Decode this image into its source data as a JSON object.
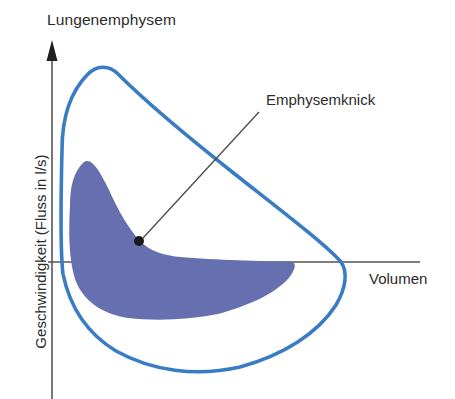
{
  "chart_data": {
    "type": "line",
    "title": "Lungenemphysem",
    "subtitle": "",
    "xlabel": "Volumen",
    "ylabel": "Geschwindigkeit (Fluss in l/s)",
    "grid": false,
    "legend_position": "none",
    "axis_style": {
      "y_axis_arrow": true,
      "x_axis_arrow": false,
      "x_axis_ticks": false,
      "y_axis_ticks": false,
      "axis_color": "#555555"
    },
    "colors": {
      "outline_curve": "#3a7cc4",
      "filled_curve": "#6670b0",
      "annotation_marker": "#1a1a1a",
      "annotation_leader": "#4a4a4a",
      "background": "#ffffff",
      "text": "#2b2b2b"
    },
    "annotations": [
      {
        "text": "Emphysemknick",
        "marker_x": 139,
        "marker_y": 241,
        "leader_to_x": 259,
        "leader_to_y": 112,
        "description": "Knick im exspiratorischen Schenkel der Fluss-Volumen-Kurve"
      }
    ],
    "series": [
      {
        "name": "Emphysem-Fluss-Volumen-Schleife (Aussenkurve)",
        "color": "#3a7cc4",
        "filled": false,
        "style": "loop",
        "points": [
          [
            62,
            148
          ],
          [
            63,
            120
          ],
          [
            68,
            98
          ],
          [
            78,
            82
          ],
          [
            90,
            70
          ],
          [
            102,
            66
          ],
          [
            118,
            73
          ],
          [
            140,
            92
          ],
          [
            170,
            118
          ],
          [
            205,
            148
          ],
          [
            245,
            180
          ],
          [
            285,
            212
          ],
          [
            315,
            238
          ],
          [
            335,
            258
          ],
          [
            344,
            272
          ],
          [
            345,
            288
          ],
          [
            338,
            305
          ],
          [
            322,
            324
          ],
          [
            298,
            343
          ],
          [
            268,
            358
          ],
          [
            235,
            368
          ],
          [
            200,
            372
          ],
          [
            165,
            369
          ],
          [
            135,
            360
          ],
          [
            108,
            345
          ],
          [
            86,
            325
          ],
          [
            70,
            300
          ],
          [
            62,
            272
          ],
          [
            59,
            240
          ],
          [
            59,
            200
          ],
          [
            62,
            148
          ]
        ]
      },
      {
        "name": "Emphysem-Fluss-Volumen-Schleife (gefuellte Flaeche)",
        "color": "#6670b0",
        "filled": true,
        "style": "loop",
        "points": [
          [
            70,
            206
          ],
          [
            72,
            188
          ],
          [
            77,
            173
          ],
          [
            84,
            162
          ],
          [
            90,
            160
          ],
          [
            97,
            167
          ],
          [
            105,
            182
          ],
          [
            114,
            201
          ],
          [
            124,
            219
          ],
          [
            133,
            232
          ],
          [
            142,
            243
          ],
          [
            152,
            250
          ],
          [
            168,
            255
          ],
          [
            195,
            258
          ],
          [
            230,
            260
          ],
          [
            265,
            261
          ],
          [
            290,
            262
          ],
          [
            296,
            264
          ],
          [
            293,
            272
          ],
          [
            283,
            283
          ],
          [
            266,
            295
          ],
          [
            243,
            306
          ],
          [
            215,
            314
          ],
          [
            185,
            319
          ],
          [
            155,
            320
          ],
          [
            128,
            318
          ],
          [
            106,
            311
          ],
          [
            89,
            300
          ],
          [
            78,
            283
          ],
          [
            72,
            262
          ],
          [
            69,
            238
          ],
          [
            70,
            206
          ]
        ]
      }
    ],
    "x_axis_line": {
      "x_start": 48,
      "x_end": 420,
      "y": 262
    },
    "y_axis_line": {
      "x": 52,
      "y_start": 50,
      "y_end": 399
    }
  },
  "chart": {
    "title": "Lungenemphysem",
    "xlabel": "Volumen",
    "ylabel": "Geschwindigkeit (Fluss in l/s)",
    "annotation": "Emphysemknick"
  }
}
